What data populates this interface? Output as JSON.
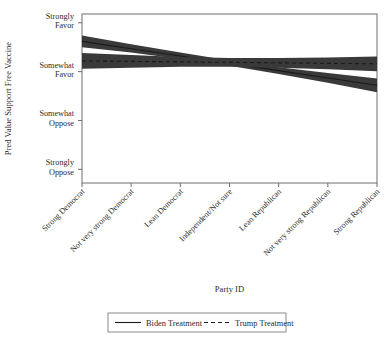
{
  "chart_data": {
    "type": "line",
    "title": "",
    "xlabel": "Party ID",
    "ylabel": "Pred Value Support Free Vaccine",
    "grid": false,
    "legend_position": "bottom",
    "categories": [
      "Strong Democrat",
      "Not very strong Democrat",
      "Lean Democrat",
      "Independent/Not sure",
      "Lean Republican",
      "Not very strong Republican",
      "Strong Republican"
    ],
    "ytick_labels": [
      "Strongly Favor",
      "Somewhat Favor",
      "Somewhat Oppose",
      "Strongly Oppose"
    ],
    "ytick_values": [
      4,
      3,
      2,
      1
    ],
    "ylim": [
      0.72,
      4.18
    ],
    "series": [
      {
        "name": "Biden Treatment",
        "style": "solid",
        "values": [
          3.62,
          3.47,
          3.32,
          3.17,
          3.02,
          2.87,
          2.72
        ],
        "ci_lower": [
          3.5,
          3.39,
          3.26,
          3.12,
          2.95,
          2.77,
          2.58
        ],
        "ci_upper": [
          3.74,
          3.56,
          3.39,
          3.23,
          3.09,
          2.97,
          2.86
        ]
      },
      {
        "name": "Trump Treatment",
        "style": "dashed",
        "values": [
          3.22,
          3.21,
          3.2,
          3.19,
          3.18,
          3.17,
          3.16
        ],
        "ci_lower": [
          3.06,
          3.08,
          3.1,
          3.1,
          3.08,
          3.05,
          3.01
        ],
        "ci_upper": [
          3.38,
          3.34,
          3.3,
          3.28,
          3.28,
          3.29,
          3.31
        ]
      }
    ],
    "colors": {
      "band": "#3a3a3a",
      "line": "#1a1a1a",
      "axis": "#6f6f6f",
      "background": "#ffffff"
    }
  },
  "legend": {
    "entries": [
      {
        "label": "Biden Treatment",
        "style": "solid"
      },
      {
        "label": "Trump Treatment",
        "style": "dashed"
      }
    ]
  }
}
